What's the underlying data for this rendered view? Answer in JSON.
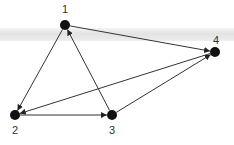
{
  "graph": {
    "type": "directed",
    "nodes": [
      {
        "id": "1",
        "label": "1",
        "x": 65,
        "y": 25,
        "lx": 65,
        "ly": 13
      },
      {
        "id": "2",
        "label": "2",
        "x": 15,
        "y": 115,
        "lx": 15,
        "ly": 134
      },
      {
        "id": "3",
        "label": "3",
        "x": 112,
        "y": 115,
        "lx": 112,
        "ly": 134
      },
      {
        "id": "4",
        "label": "4",
        "x": 215,
        "y": 52,
        "lx": 216,
        "ly": 44
      }
    ],
    "edges": [
      {
        "from": "1",
        "to": "2"
      },
      {
        "from": "3",
        "to": "1"
      },
      {
        "from": "1",
        "to": "4"
      },
      {
        "from": "4",
        "to": "2"
      },
      {
        "from": "2",
        "to": "3"
      },
      {
        "from": "3",
        "to": "4"
      }
    ]
  },
  "colors": {
    "node": "#111111",
    "edge": "#333333",
    "band": "#e4e4e4"
  }
}
